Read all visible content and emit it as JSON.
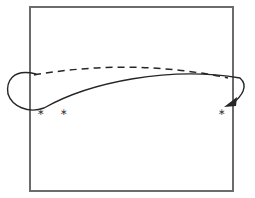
{
  "figure": {
    "title": "",
    "background_color": "#ffffff",
    "width": 255,
    "height": 198
  },
  "grid": {
    "name": "cell-grid",
    "columns": 9,
    "rows": 8,
    "left": 30,
    "top": 7,
    "right": 233,
    "bottom": 191,
    "cell_width": 22.56,
    "cell_height": 23.0,
    "line_color": "#6b6b6b",
    "fill_color": "#ffffff"
  },
  "markers": {
    "glyph": "∗",
    "color": "#3a3a3a",
    "items": [
      {
        "label": "∗",
        "column": 1,
        "row": 5,
        "x": 41,
        "y": 113
      },
      {
        "label": "∗",
        "column": 2,
        "row": 5,
        "x": 64,
        "y": 113
      },
      {
        "label": "∗",
        "column": 9,
        "row": 5,
        "x": 222,
        "y": 113
      }
    ]
  },
  "dashed_arc": {
    "name": "dashed-trajectory",
    "style": "dashed",
    "color": "#262626",
    "dash_pattern": "7 5",
    "start_x": 34,
    "start_y": 75,
    "peak_x": 133,
    "peak_y": 66,
    "end_x": 228,
    "end_y": 78
  },
  "loop_arrow": {
    "name": "return-loop-arrow",
    "style": "solid",
    "color": "#262626",
    "start_x": 36,
    "start_y": 74,
    "leftmost_x": 6,
    "end_x": 232,
    "end_y": 104,
    "arrowhead_direction": "down-left"
  },
  "colors": {
    "grid": "#6b6b6b",
    "ink": "#262626",
    "marker": "#3a3a3a",
    "paper": "#ffffff"
  }
}
